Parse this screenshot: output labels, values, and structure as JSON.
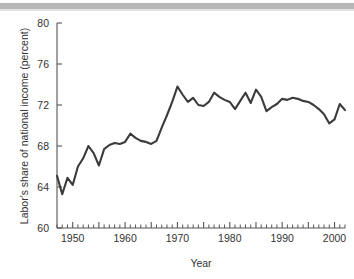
{
  "figure": {
    "background_color": "#ffffff",
    "top_rule_color": "#b8b8b8",
    "line_color": "#3b3b3b",
    "axis_color": "#555555"
  },
  "chart_data": {
    "type": "line",
    "title": "",
    "subtitle": "",
    "xlabel": "Year",
    "ylabel": "Labor's share of national income (percent)",
    "xlim": [
      1947,
      2002
    ],
    "ylim": [
      60,
      80
    ],
    "grid": false,
    "legend": "none",
    "x_ticks": [
      1950,
      1960,
      1970,
      1980,
      1990,
      2000
    ],
    "x_tick_labels": [
      "1950",
      "1960",
      "1970",
      "1980",
      "1990",
      "2000"
    ],
    "x_minor_tick_step": 1,
    "y_ticks": [
      60,
      64,
      68,
      72,
      76,
      80
    ],
    "y_tick_labels": [
      "60",
      "64",
      "68",
      "72",
      "76",
      "80"
    ],
    "series": [
      {
        "name": "Labor's share of national income",
        "x": [
          1947,
          1948,
          1949,
          1950,
          1951,
          1952,
          1953,
          1954,
          1955,
          1956,
          1957,
          1958,
          1959,
          1960,
          1961,
          1962,
          1963,
          1964,
          1965,
          1966,
          1967,
          1968,
          1969,
          1970,
          1971,
          1972,
          1973,
          1974,
          1975,
          1976,
          1977,
          1978,
          1979,
          1980,
          1981,
          1982,
          1983,
          1984,
          1985,
          1986,
          1987,
          1988,
          1989,
          1990,
          1991,
          1992,
          1993,
          1994,
          1995,
          1996,
          1997,
          1998,
          1999,
          2000,
          2001,
          2002
        ],
        "values": [
          65.1,
          63.3,
          64.9,
          64.2,
          66.0,
          66.8,
          68.0,
          67.3,
          66.1,
          67.7,
          68.1,
          68.3,
          68.2,
          68.4,
          69.2,
          68.8,
          68.5,
          68.4,
          68.2,
          68.5,
          69.8,
          71.0,
          72.3,
          73.8,
          73.0,
          72.3,
          72.7,
          72.0,
          71.9,
          72.3,
          73.2,
          72.8,
          72.5,
          72.3,
          71.6,
          72.4,
          73.2,
          72.2,
          73.5,
          72.8,
          71.4,
          71.8,
          72.1,
          72.6,
          72.5,
          72.7,
          72.6,
          72.4,
          72.3,
          72.0,
          71.6,
          71.1,
          70.2,
          70.6,
          72.1,
          71.5
        ]
      }
    ]
  }
}
